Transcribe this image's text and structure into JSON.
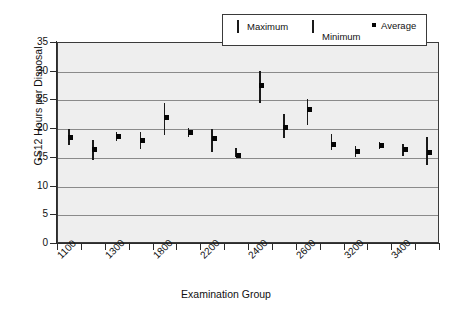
{
  "chart_data": {
    "type": "scatter",
    "title": "",
    "xlabel": "Examination Group",
    "ylabel": "GS12 Hours per Disposal",
    "ylim": [
      0,
      35
    ],
    "ytick_values": [
      35,
      30,
      25,
      20,
      15,
      10,
      5,
      0
    ],
    "ytick_labels": [
      "35",
      "30",
      "25",
      "20",
      "15",
      "10",
      "5",
      "0"
    ],
    "grid": true,
    "grid_axis": "y",
    "legend_position": "top-right",
    "legend": [
      {
        "name": "Maximum",
        "marker": "vertical-line-upper"
      },
      {
        "name": "Minimum",
        "marker": "vertical-line-lower"
      },
      {
        "name": "Average",
        "marker": "square"
      }
    ],
    "xtick_labels": [
      "1100",
      "",
      "1300",
      "",
      "1800",
      "",
      "2200",
      "",
      "2400",
      "",
      "2600",
      "",
      "3200",
      "",
      "3400",
      ""
    ],
    "xtick_shown": [
      "1100",
      "1300",
      "1800",
      "2200",
      "2400",
      "2600",
      "3200",
      "3400"
    ],
    "categories": [
      "1100",
      "1200",
      "1300",
      "1500",
      "1800",
      "2000",
      "2200",
      "2300",
      "2400",
      "2500",
      "2600",
      "2800",
      "3200",
      "3300",
      "3400"
    ],
    "series": [
      {
        "name": "Maximum",
        "values": [
          19.9,
          18.0,
          19.4,
          19.3,
          24.3,
          20.0,
          19.8,
          16.5,
          22.5,
          25.0,
          18.9,
          16.9,
          17.6,
          17.2,
          18.5
        ]
      },
      {
        "name": "Average",
        "values": [
          18.4,
          16.2,
          18.6,
          17.9,
          21.8,
          19.2,
          18.2,
          15.3,
          20.1,
          23.2,
          17.1,
          16.0,
          16.9,
          16.3,
          15.7
        ]
      },
      {
        "name": "Minimum",
        "values": [
          17.0,
          14.5,
          17.7,
          16.4,
          18.8,
          18.4,
          15.8,
          14.9,
          18.2,
          20.6,
          16.2,
          14.9,
          16.3,
          15.2,
          13.5
        ]
      }
    ],
    "points": [
      {
        "group": "1100",
        "max": 19.9,
        "avg": 18.4,
        "min": 17.0
      },
      {
        "group": "1200",
        "max": 18.0,
        "avg": 16.2,
        "min": 14.5
      },
      {
        "group": "1300",
        "max": 19.4,
        "avg": 18.6,
        "min": 17.7
      },
      {
        "group": "1500",
        "max": 19.3,
        "avg": 17.9,
        "min": 16.4
      },
      {
        "group": "1800",
        "max": 24.3,
        "avg": 21.8,
        "min": 18.8
      },
      {
        "group": "2000",
        "max": 20.0,
        "avg": 19.2,
        "min": 18.4
      },
      {
        "group": "2200",
        "max": 19.8,
        "avg": 18.2,
        "min": 15.8
      },
      {
        "group": "2300",
        "max": 16.5,
        "avg": 15.3,
        "min": 14.9
      },
      {
        "group": "2400",
        "max": 29.9,
        "avg": 27.4,
        "min": 24.4
      },
      {
        "group": "2500",
        "max": 22.5,
        "avg": 20.1,
        "min": 18.2
      },
      {
        "group": "2600",
        "max": 25.0,
        "avg": 23.2,
        "min": 20.6
      },
      {
        "group": "2800",
        "max": 18.9,
        "avg": 17.1,
        "min": 16.2
      },
      {
        "group": "3200",
        "max": 16.9,
        "avg": 16.0,
        "min": 14.9
      },
      {
        "group": "3300",
        "max": 17.6,
        "avg": 16.9,
        "min": 16.3
      },
      {
        "group": "3400",
        "max": 17.2,
        "avg": 16.3,
        "min": 15.2
      },
      {
        "group": "3500",
        "max": 18.5,
        "avg": 15.7,
        "min": 13.5
      }
    ]
  },
  "colors": {
    "plot_background": "#eeeeee",
    "axis": "#2b2b2b",
    "gridline": "#8a8a8a",
    "marker": "#050505",
    "page_background": "#ffffff"
  }
}
